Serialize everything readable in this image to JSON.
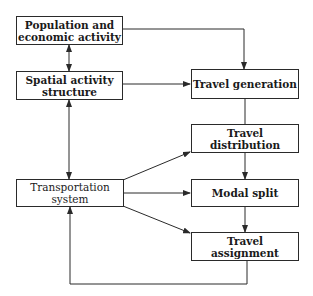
{
  "diagram": {
    "type": "flowchart",
    "nodes": [
      {
        "id": "population",
        "label": "Population and\neconomic activity",
        "bold": true
      },
      {
        "id": "spatial",
        "label": "Spatial activity\nstructure",
        "bold": true
      },
      {
        "id": "transport",
        "label": "Transportation\nsystem",
        "bold": false
      },
      {
        "id": "generation",
        "label": "Travel generation",
        "bold": true
      },
      {
        "id": "distribution",
        "label": "Travel distribution",
        "bold": true
      },
      {
        "id": "modal",
        "label": "Modal split",
        "bold": true
      },
      {
        "id": "assignment",
        "label": "Travel assignment",
        "bold": true
      }
    ],
    "edges": [
      {
        "from": "population",
        "to": "spatial",
        "bidirectional": true
      },
      {
        "from": "spatial",
        "to": "transport",
        "bidirectional": true
      },
      {
        "from": "population",
        "to": "generation"
      },
      {
        "from": "spatial",
        "to": "generation"
      },
      {
        "from": "generation",
        "to": "distribution"
      },
      {
        "from": "distribution",
        "to": "modal"
      },
      {
        "from": "modal",
        "to": "assignment"
      },
      {
        "from": "transport",
        "to": "distribution"
      },
      {
        "from": "transport",
        "to": "modal"
      },
      {
        "from": "transport",
        "to": "assignment"
      },
      {
        "from": "assignment",
        "to": "transport",
        "feedback": true
      }
    ],
    "colors": {
      "line": "#2a2a2a",
      "background": "#ffffff",
      "text": "#1a1a1a"
    }
  }
}
